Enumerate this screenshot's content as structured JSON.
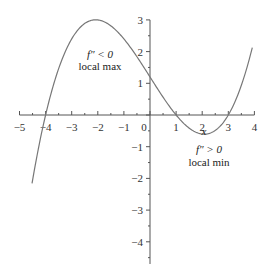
{
  "chart_data": {
    "type": "line",
    "title": "",
    "xlabel": "x",
    "ylabel": "",
    "xlim": [
      -5,
      4
    ],
    "ylim": [
      -4.7,
      3
    ],
    "grid": false,
    "x_ticks": [
      -5,
      -4,
      -3,
      -2,
      -1,
      0,
      1,
      2,
      3,
      4
    ],
    "x_tick_labels": [
      "−5",
      "−4",
      "−3",
      "−2",
      "−1",
      "0",
      "1",
      "2",
      "3",
      "4"
    ],
    "y_ticks": [
      3,
      2,
      1,
      -1,
      -2,
      -3,
      -4
    ],
    "y_tick_labels": [
      "3",
      "2",
      "1",
      "−1",
      "−2",
      "−3",
      "−4"
    ],
    "series": [
      {
        "name": "f(x) = 0.1(x+4)(x−1)(x−3)",
        "x": [
          -4.5,
          -4,
          -3.5,
          -3,
          -2.5,
          -2.1,
          -1.5,
          -1,
          -0.5,
          0,
          0.5,
          1,
          1.5,
          2,
          2.1,
          2.5,
          3,
          3.5,
          3.95
        ],
        "values": [
          -3.24,
          0,
          1.69,
          2.4,
          2.48,
          3.0,
          2.82,
          2.4,
          1.82,
          1.2,
          0.56,
          0,
          -0.41,
          -0.6,
          -0.6,
          -0.49,
          0,
          0.84,
          2.3
        ]
      }
    ],
    "roots": [
      -4,
      1,
      3
    ],
    "annotations": [
      {
        "line1": "f″ < 0",
        "line2": "local max",
        "x": -2.1,
        "y": 3.0
      },
      {
        "line1": "f″ > 0",
        "line2": "local min",
        "x": 2.1,
        "y": -0.6
      }
    ]
  },
  "labels": {
    "x_axis": "x",
    "max_cond": "f″ < 0",
    "max_text": "local max",
    "min_cond": "f″ > 0",
    "min_text": "local min"
  }
}
